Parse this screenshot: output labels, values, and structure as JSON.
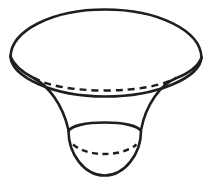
{
  "figure": {
    "name": "funnel-solid",
    "background_color": "#ffffff",
    "stroke_color": "#1e1e22",
    "canvas": {
      "width": 213,
      "height": 190
    },
    "parts": {
      "top_rim_front": {
        "label": "top-rim-front-arc",
        "style": "solid",
        "stroke_width": 2.6,
        "path": "M 10.5,56.5 C 11.5,76.5 52,96.5 105,96.5 C 158,96.5 199.5,77.5 201.5,57.5"
      },
      "top_rim_back": {
        "label": "top-rim-back-arc",
        "style": "solid",
        "stroke_width": 2.6,
        "path": "M 10.5,56.5 C 11.5,30.5 52,9.5 105,9.5 C 158,9.5 200.5,30.5 201.5,57.5"
      },
      "top_ellipse_hidden": {
        "label": "top-ellipse-hidden-back-arc",
        "style": "dashed",
        "stroke_width": 2.4,
        "dash_pattern": "7 5",
        "path": "M 33.5,77.5 C 46,85.5 73,90.5 105,90.5 C 137,90.5 163.5,85.5 176.5,77.5"
      },
      "side_left": {
        "label": "funnel-left-side-curve",
        "style": "solid",
        "stroke_width": 2.6,
        "path": "M 10.5,56.5 C 14,66 24,73 33.5,78 C 48,85.5 62.5,104 68.5,130"
      },
      "side_right": {
        "label": "funnel-right-side-curve",
        "style": "solid",
        "stroke_width": 2.6,
        "path": "M 201.5,57.5 C 198,67 188,73.5 176.5,78 C 161,84 146,104 141,130"
      },
      "bowl_rim_top": {
        "label": "bottom-bowl-rim-top-arc",
        "style": "solid",
        "stroke_width": 2.6,
        "path": "M 68.5,131 C 71,126 85,122.5 104.5,122.5 C 124,122.5 138.5,126 141,131"
      },
      "bowl_bottom": {
        "label": "bottom-bowl-lower-arc",
        "style": "solid",
        "stroke_width": 2.6,
        "path": "M 68.5,131 C 68.5,154 84.5,175.5 104.5,175.5 C 124.5,175.5 141,154 141,131"
      },
      "bowl_hidden": {
        "label": "bottom-bowl-hidden-back-arc",
        "style": "dashed",
        "stroke_width": 2.4,
        "dash_pattern": "6 4.5",
        "path": "M 73,144.5 C 80,150.5 91.5,154 104.5,154 C 117.5,154 129.5,150.5 136.5,144.5"
      }
    }
  }
}
